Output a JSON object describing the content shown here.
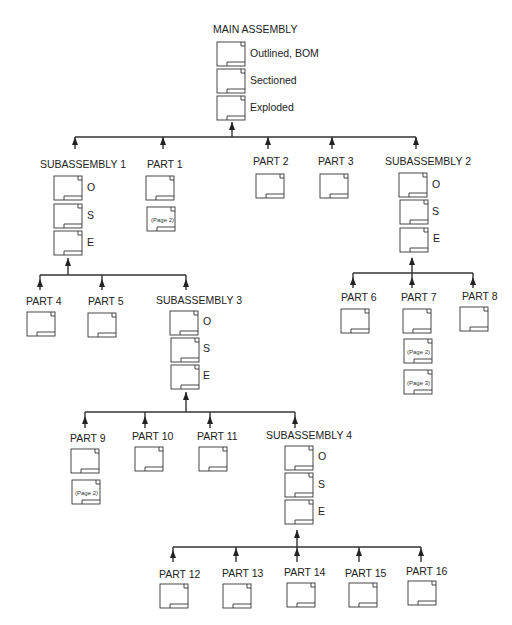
{
  "diagram": {
    "type": "drawing-tree",
    "root": {
      "id": "main",
      "label": "MAIN ASSEMBLY",
      "views": [
        "Outlined, BOM",
        "Sectioned",
        "Exploded"
      ]
    },
    "nodes": [
      {
        "id": "sub1",
        "label": "SUBASSEMBLY 1",
        "parent": "main",
        "views": [
          "O",
          "S",
          "E"
        ]
      },
      {
        "id": "p1",
        "label": "PART 1",
        "parent": "main",
        "pages": [
          "(Page 2)"
        ]
      },
      {
        "id": "p2",
        "label": "PART 2",
        "parent": "main"
      },
      {
        "id": "p3",
        "label": "PART 3",
        "parent": "main"
      },
      {
        "id": "sub2",
        "label": "SUBASSEMBLY 2",
        "parent": "main",
        "views": [
          "O",
          "S",
          "E"
        ]
      },
      {
        "id": "p4",
        "label": "PART 4",
        "parent": "sub1"
      },
      {
        "id": "p5",
        "label": "PART 5",
        "parent": "sub1"
      },
      {
        "id": "sub3",
        "label": "SUBASSEMBLY 3",
        "parent": "sub1",
        "views": [
          "O",
          "S",
          "E"
        ]
      },
      {
        "id": "p6",
        "label": "PART 6",
        "parent": "sub2"
      },
      {
        "id": "p7",
        "label": "PART 7",
        "parent": "sub2",
        "pages": [
          "(Page 2)",
          "(Page 3)"
        ]
      },
      {
        "id": "p8",
        "label": "PART 8",
        "parent": "sub2"
      },
      {
        "id": "p9",
        "label": "PART 9",
        "parent": "sub3",
        "pages": [
          "(Page 2)"
        ]
      },
      {
        "id": "p10",
        "label": "PART 10",
        "parent": "sub3"
      },
      {
        "id": "p11",
        "label": "PART 11",
        "parent": "sub3"
      },
      {
        "id": "sub4",
        "label": "SUBASSEMBLY 4",
        "parent": "sub3",
        "views": [
          "O",
          "S",
          "E"
        ]
      },
      {
        "id": "p12",
        "label": "PART 12",
        "parent": "sub4"
      },
      {
        "id": "p13",
        "label": "PART 13",
        "parent": "sub4"
      },
      {
        "id": "p14",
        "label": "PART 14",
        "parent": "sub4"
      },
      {
        "id": "p15",
        "label": "PART 15",
        "parent": "sub4"
      },
      {
        "id": "p16",
        "label": "PART 16",
        "parent": "sub4"
      }
    ]
  },
  "labels": {
    "main": "MAIN ASSEMBLY",
    "main_v1": "Outlined, BOM",
    "main_v2": "Sectioned",
    "main_v3": "Exploded",
    "sub1": "SUBASSEMBLY 1",
    "sub2": "SUBASSEMBLY 2",
    "sub3": "SUBASSEMBLY 3",
    "sub4": "SUBASSEMBLY 4",
    "view_o": "O",
    "view_s": "S",
    "view_e": "E",
    "p1": "PART 1",
    "p2": "PART 2",
    "p3": "PART 3",
    "p4": "PART 4",
    "p5": "PART 5",
    "p6": "PART 6",
    "p7": "PART 7",
    "p8": "PART 8",
    "p9": "PART 9",
    "p10": "PART 10",
    "p11": "PART 11",
    "p12": "PART 12",
    "p13": "PART 13",
    "p14": "PART 14",
    "p15": "PART 15",
    "p16": "PART 16",
    "page2": "(Page 2)",
    "page3": "(Page 3)"
  }
}
